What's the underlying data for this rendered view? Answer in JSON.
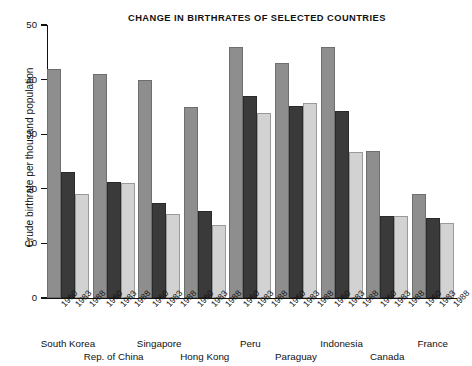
{
  "chart_data": {
    "type": "bar",
    "title": "CHANGE IN BIRTHRATES OF SELECTED COUNTRIES",
    "xlabel": "",
    "ylabel": "Crude birthrate per thousand population",
    "ylim": [
      0,
      50
    ],
    "yticks": [
      0,
      10,
      20,
      30,
      40,
      50
    ],
    "grid": false,
    "legend": "none",
    "categories": [
      "South Korea",
      "Rep. of China",
      "Singapore",
      "Hong Kong",
      "Peru",
      "Paraguay",
      "Indonesia",
      "Canada",
      "France"
    ],
    "x": [
      "1960",
      "1983",
      "1988"
    ],
    "series": [
      {
        "name": "1960",
        "color": "#8e8e8e",
        "values": [
          42.0,
          41.0,
          40.0,
          35.0,
          46.0,
          43.0,
          46.0,
          27.0,
          19.0
        ]
      },
      {
        "name": "1983",
        "color": "#3a3a3a",
        "values": [
          23.0,
          21.2,
          17.4,
          15.9,
          37.0,
          35.2,
          34.2,
          15.0,
          14.7
        ]
      },
      {
        "name": "1988",
        "color": "#d2d2d2",
        "values": [
          19.1,
          21.0,
          15.3,
          13.3,
          33.8,
          35.7,
          26.8,
          15.0,
          13.8
        ]
      }
    ],
    "groups": [
      {
        "country": "South Korea",
        "row": 0,
        "values": {
          "1960": 42.0,
          "1983": 23.0,
          "1988": 19.1
        }
      },
      {
        "country": "Rep. of China",
        "row": 1,
        "values": {
          "1960": 41.0,
          "1983": 21.2,
          "1988": 21.0
        }
      },
      {
        "country": "Singapore",
        "row": 0,
        "values": {
          "1960": 40.0,
          "1983": 17.4,
          "1988": 15.3
        }
      },
      {
        "country": "Hong Kong",
        "row": 1,
        "values": {
          "1960": 35.0,
          "1983": 15.9,
          "1988": 13.3
        }
      },
      {
        "country": "Peru",
        "row": 0,
        "values": {
          "1960": 46.0,
          "1983": 37.0,
          "1988": 33.8
        }
      },
      {
        "country": "Paraguay",
        "row": 1,
        "values": {
          "1960": 43.0,
          "1983": 35.2,
          "1988": 35.7
        }
      },
      {
        "country": "Indonesia",
        "row": 0,
        "values": {
          "1960": 46.0,
          "1983": 34.2,
          "1988": 26.8
        }
      },
      {
        "country": "Canada",
        "row": 1,
        "values": {
          "1960": 27.0,
          "1983": 15.0,
          "1988": 15.0
        }
      },
      {
        "country": "France",
        "row": 0,
        "values": {
          "1960": 19.0,
          "1983": 14.7,
          "1988": 13.8
        }
      }
    ]
  }
}
